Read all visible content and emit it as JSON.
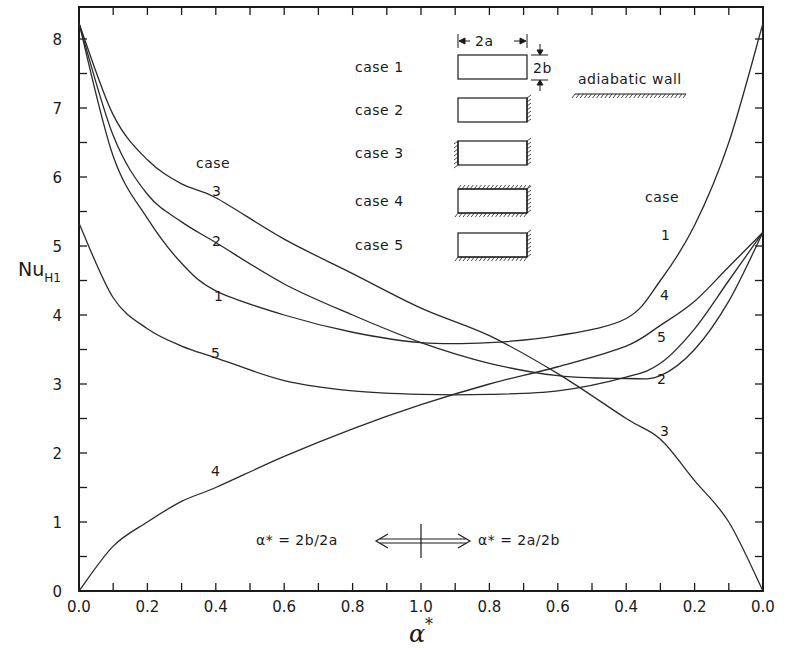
{
  "chart_data": {
    "type": "line",
    "title": "",
    "xlabel": "α*",
    "ylabel": "Nu_H1",
    "ylabel_main": "Nu",
    "ylabel_sub": "H1",
    "ylim": [
      0,
      8.3
    ],
    "xlim_position": [
      0,
      2
    ],
    "grid": false,
    "x_note": "Horizontal axis is split at center: left half α* = 2b/2a from 0.0 to 1.0; right half α* = 2a/2b from 1.0 back to 0.0",
    "x_tick_labels": [
      "0.0",
      "0.2",
      "0.4",
      "0.6",
      "0.8",
      "1.0",
      "0.8",
      "0.6",
      "0.4",
      "0.2",
      "0.0"
    ],
    "y_tick_labels": [
      "0",
      "1",
      "2",
      "3",
      "4",
      "5",
      "6",
      "7",
      "8"
    ],
    "x_position": [
      0.0,
      0.1,
      0.2,
      0.3,
      0.4,
      0.6,
      0.8,
      1.0,
      1.2,
      1.4,
      1.6,
      1.7,
      1.8,
      1.9,
      2.0
    ],
    "series": [
      {
        "name": "case 1",
        "values": [
          8.23,
          6.3,
          5.4,
          4.75,
          4.35,
          4.0,
          3.75,
          3.6,
          3.6,
          3.7,
          3.95,
          4.5,
          5.3,
          6.5,
          8.23
        ]
      },
      {
        "name": "case 2",
        "values": [
          8.23,
          6.6,
          5.75,
          5.35,
          5.05,
          4.45,
          4.0,
          3.6,
          3.3,
          3.12,
          3.08,
          3.12,
          3.5,
          4.2,
          5.2
        ]
      },
      {
        "name": "case 3",
        "values": [
          8.23,
          6.9,
          6.25,
          5.9,
          5.7,
          5.1,
          4.6,
          4.1,
          3.7,
          3.15,
          2.5,
          2.2,
          1.6,
          1.0,
          0.0
        ]
      },
      {
        "name": "case 4",
        "values": [
          0.0,
          0.65,
          1.0,
          1.3,
          1.5,
          1.95,
          2.35,
          2.7,
          3.0,
          3.25,
          3.55,
          3.85,
          4.2,
          4.7,
          5.2
        ]
      },
      {
        "name": "case 5",
        "values": [
          5.33,
          4.25,
          3.8,
          3.55,
          3.38,
          3.05,
          2.9,
          2.85,
          2.85,
          2.9,
          3.1,
          3.3,
          3.8,
          4.5,
          5.2
        ]
      }
    ],
    "curve_labels_left": {
      "header": "case",
      "items": [
        {
          "label": "3",
          "series": "case 3"
        },
        {
          "label": "2",
          "series": "case 2"
        },
        {
          "label": "1",
          "series": "case 1"
        },
        {
          "label": "5",
          "series": "case 5"
        },
        {
          "label": "4",
          "series": "case 4"
        }
      ]
    },
    "curve_labels_right": {
      "header": "case",
      "items": [
        {
          "label": "1",
          "series": "case 1"
        },
        {
          "label": "4",
          "series": "case 4"
        },
        {
          "label": "5",
          "series": "case 5"
        },
        {
          "label": "2",
          "series": "case 2"
        },
        {
          "label": "3",
          "series": "case 3"
        }
      ]
    },
    "legend": {
      "dimension_width": "2a",
      "dimension_height": "2b",
      "adiabatic_label": "adiabatic wall",
      "cases": [
        {
          "label": "case 1",
          "adiabatic_sides": []
        },
        {
          "label": "case 2",
          "adiabatic_sides": [
            "right"
          ]
        },
        {
          "label": "case 3",
          "adiabatic_sides": [
            "left",
            "right"
          ]
        },
        {
          "label": "case 4",
          "adiabatic_sides": [
            "top",
            "right",
            "bottom"
          ]
        },
        {
          "label": "case 5",
          "adiabatic_sides": [
            "right",
            "bottom"
          ]
        }
      ]
    },
    "annotation": {
      "left_text": "α* = 2b/2a",
      "right_text": "α* = 2a/2b"
    }
  },
  "colors": {
    "ink": "#1a1a1a",
    "background": "#ffffff"
  }
}
